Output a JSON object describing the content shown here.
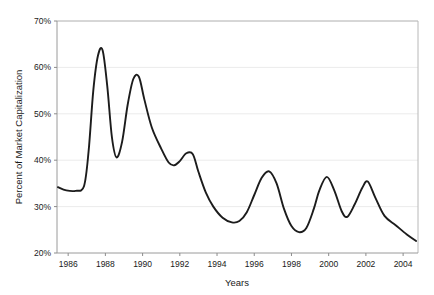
{
  "chart_data": {
    "type": "line",
    "title": "",
    "xlabel": "Years",
    "ylabel": "Percent of Market Capitalization",
    "xlim": [
      1985.4,
      2004.8
    ],
    "ylim": [
      20,
      70
    ],
    "xticks": [
      1986,
      1988,
      1990,
      1992,
      1994,
      1996,
      1998,
      2000,
      2002,
      2004
    ],
    "xtick_labels": [
      "1986",
      "1988",
      "1990",
      "1992",
      "1994",
      "1996",
      "1998",
      "2000",
      "2002",
      "2004"
    ],
    "yticks": [
      20,
      30,
      40,
      50,
      60,
      70
    ],
    "ytick_labels": [
      "20%",
      "30%",
      "40%",
      "50%",
      "60%",
      "70%"
    ],
    "grid": true,
    "grid_axis": "y",
    "legend": false,
    "line_color": "#1c1c1c",
    "grid_color": "#e2e2e2",
    "axis_color": "#9a9a9a",
    "background_color": "#ffffff",
    "series": [
      {
        "name": "Percent of Market Capitalization",
        "x": [
          1985.45,
          1985.9,
          1986.4,
          1986.85,
          1987.1,
          1987.35,
          1987.6,
          1987.85,
          1988.1,
          1988.35,
          1988.6,
          1988.9,
          1989.2,
          1989.5,
          1989.8,
          1990.1,
          1990.5,
          1991.0,
          1991.4,
          1991.7,
          1992.0,
          1992.35,
          1992.7,
          1993.0,
          1993.4,
          1993.8,
          1994.3,
          1994.8,
          1995.2,
          1995.6,
          1996.0,
          1996.4,
          1996.8,
          1997.2,
          1997.6,
          1998.0,
          1998.4,
          1998.8,
          1999.2,
          1999.5,
          1999.9,
          2000.3,
          2000.7,
          2001.0,
          2001.4,
          2001.8,
          2002.1,
          2002.5,
          2003.0,
          2003.6,
          2004.2,
          2004.7
        ],
        "y": [
          34.2,
          33.5,
          33.4,
          34.4,
          42.0,
          55.0,
          62.5,
          63.7,
          56.0,
          45.0,
          40.6,
          44.0,
          52.0,
          57.5,
          58.0,
          53.0,
          47.0,
          42.5,
          39.5,
          38.9,
          39.8,
          41.5,
          41.3,
          37.5,
          33.0,
          30.0,
          27.6,
          26.6,
          26.9,
          28.8,
          32.5,
          36.2,
          37.6,
          35.0,
          29.5,
          25.8,
          24.5,
          25.4,
          29.5,
          33.5,
          36.4,
          33.5,
          29.0,
          27.8,
          30.5,
          34.0,
          35.4,
          32.0,
          28.0,
          26.0,
          24.0,
          22.6
        ]
      }
    ]
  },
  "axis": {
    "y_title": "Percent of Market Capitalization",
    "x_title": "Years"
  }
}
